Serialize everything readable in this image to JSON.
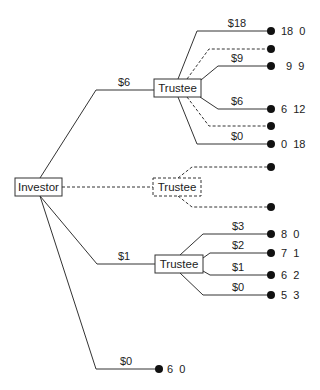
{
  "diagram": {
    "type": "game-tree",
    "nodes": {
      "investor": {
        "label": "Investor"
      },
      "trustee_top": {
        "label": "Trustee",
        "style": "solid"
      },
      "trustee_middle": {
        "label": "Trustee",
        "style": "dashed"
      },
      "trustee_bottom": {
        "label": "Trustee",
        "style": "solid"
      }
    },
    "investor_branches": [
      {
        "label": "$6",
        "to": "trustee_top"
      },
      {
        "label": "",
        "to": "trustee_middle",
        "style": "dashed"
      },
      {
        "label": "$1",
        "to": "trustee_bottom"
      },
      {
        "label": "$0",
        "payoff": "6  0"
      }
    ],
    "trustee_top_branches": [
      {
        "label": "$18",
        "payoff": "18  0",
        "style": "solid"
      },
      {
        "label": "",
        "payoff": "",
        "style": "dashed"
      },
      {
        "label": "$9",
        "payoff": "9  9",
        "style": "solid"
      },
      {
        "label": "$6",
        "payoff": "6  12",
        "style": "solid"
      },
      {
        "label": "",
        "payoff": "",
        "style": "dashed"
      },
      {
        "label": "$0",
        "payoff": "0  18",
        "style": "solid"
      }
    ],
    "trustee_middle_branches": [
      {
        "label": "",
        "payoff": "",
        "style": "dashed"
      },
      {
        "label": "",
        "payoff": "",
        "style": "dashed"
      }
    ],
    "trustee_bottom_branches": [
      {
        "label": "$3",
        "payoff": "8  0",
        "style": "solid"
      },
      {
        "label": "$2",
        "payoff": "7  1",
        "style": "solid"
      },
      {
        "label": "$1",
        "payoff": "6  2",
        "style": "solid"
      },
      {
        "label": "$0",
        "payoff": "5  3",
        "style": "solid"
      }
    ],
    "colors": {
      "line": "#333333",
      "dot": "#111111",
      "background": "#ffffff"
    }
  }
}
